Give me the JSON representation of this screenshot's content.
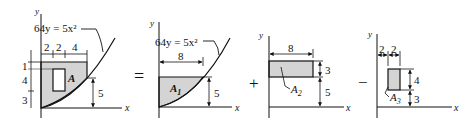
{
  "figure": {
    "colors": {
      "fill": "#d4d4d4",
      "stroke": "#111111",
      "background": "#ffffff"
    },
    "composite": {
      "equation": "64y = 5x²",
      "area_label": "A",
      "top_dims": [
        "2",
        "2",
        "4"
      ],
      "left_dims": [
        "1",
        "4",
        "3"
      ],
      "right_dim": "5",
      "x_axis": "x",
      "y_axis": "y"
    },
    "operators": {
      "equals": "=",
      "plus": "+",
      "minus": "−"
    },
    "part1": {
      "equation": "64y = 5x²",
      "area_label": "A",
      "area_sub": "1",
      "width_dim": "8",
      "height_dim": "5",
      "x_axis": "x",
      "y_axis": "y"
    },
    "part2": {
      "area_label": "A",
      "area_sub": "2",
      "width_dim": "8",
      "height_dim": "3",
      "offset_dim": "5",
      "x_axis": "x",
      "y_axis": "y"
    },
    "part3": {
      "area_label": "A",
      "area_sub": "3",
      "left_dims": [
        "2",
        "2"
      ],
      "height_dim": "4",
      "offset_dim": "3",
      "x_axis": "x",
      "y_axis": "y"
    }
  }
}
